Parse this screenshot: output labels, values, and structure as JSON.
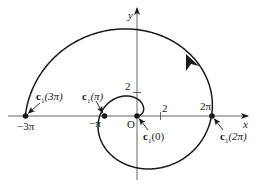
{
  "diagram": {
    "curve": "c1(t) = (t cos t, t sin t) spiral",
    "axes": {
      "x_label": "x",
      "y_label": "y",
      "origin_label": "O"
    },
    "ticks": {
      "x_tick_2": "2",
      "y_tick_2": "2",
      "neg_3pi": "−3π",
      "neg_pi": "−π",
      "two_pi": "2π"
    },
    "points": [
      {
        "name": "c",
        "sub": "1",
        "arg": "(3π)"
      },
      {
        "name": "c",
        "sub": "1",
        "arg": "(π)"
      },
      {
        "name": "c",
        "sub": "1",
        "arg": "(0)"
      },
      {
        "name": "c",
        "sub": "1",
        "arg": "(2π)"
      }
    ],
    "colors": {
      "stroke": "#1a1a1a",
      "axis": "#555555"
    }
  }
}
